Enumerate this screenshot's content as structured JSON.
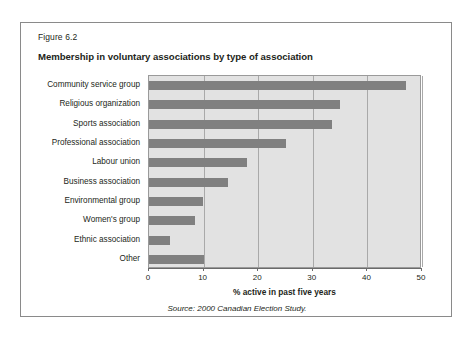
{
  "figure": {
    "number": "Figure 6.2",
    "title": "Membership in voluntary associations by type of association",
    "source": "Source: 2000 Canadian Election Study."
  },
  "colors": {
    "bar": "#808080",
    "plot_background": "#e2e2e2",
    "gridline": "#a9a9a9",
    "frame": "#8a8a8a",
    "text": "#231f20"
  },
  "chart_data": {
    "type": "bar",
    "orientation": "horizontal",
    "title": "Membership in voluntary associations by type of association",
    "subtitle": "Figure 6.2",
    "categories": [
      "Community service group",
      "Religious organization",
      "Sports association",
      "Professional association",
      "Labour union",
      "Business association",
      "Environmental group",
      "Women's group",
      "Ethnic association",
      "Other"
    ],
    "values": [
      47,
      35,
      33.5,
      25,
      18,
      14.5,
      9.8,
      8.5,
      3.8,
      10
    ],
    "xlabel": "% active in past five years",
    "ylabel": "",
    "xlim": [
      0,
      50
    ],
    "xticks": [
      0,
      10,
      20,
      30,
      40,
      50
    ],
    "xtick_labels": [
      "0",
      "10",
      "20",
      "30",
      "40",
      "50"
    ],
    "grid": true,
    "grid_axis": "x",
    "legend": false,
    "series": [
      {
        "name": "% active in past five years",
        "values": [
          47,
          35,
          33.5,
          25,
          18,
          14.5,
          9.8,
          8.5,
          3.8,
          10
        ]
      }
    ]
  }
}
